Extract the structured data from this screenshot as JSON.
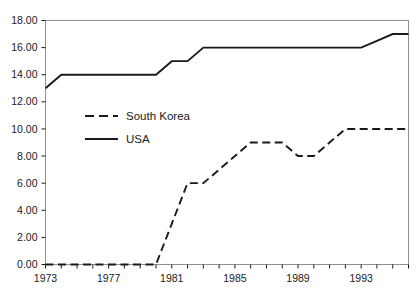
{
  "chart_data": {
    "type": "line",
    "title": "",
    "subtitle": "",
    "xlabel": "",
    "ylabel": "",
    "xlim": [
      1973,
      1996
    ],
    "ylim": [
      0,
      18
    ],
    "xticks": [
      1973,
      1974,
      1975,
      1976,
      1977,
      1978,
      1979,
      1980,
      1981,
      1982,
      1983,
      1984,
      1985,
      1986,
      1987,
      1988,
      1989,
      1990,
      1991,
      1992,
      1993,
      1994,
      1995,
      1996
    ],
    "xtick_labels": [
      "1973",
      "",
      "",
      "",
      "1977",
      "",
      "",
      "",
      "1981",
      "",
      "",
      "",
      "1985",
      "",
      "",
      "",
      "1989",
      "",
      "",
      "",
      "1993",
      "",
      "",
      ""
    ],
    "yticks": [
      0,
      2,
      4,
      6,
      8,
      10,
      12,
      14,
      16,
      18
    ],
    "ytick_labels": [
      "0.00",
      "2.00",
      "4.00",
      "6.00",
      "8.00",
      "10.00",
      "12.00",
      "14.00",
      "16.00",
      "18.00"
    ],
    "grid": false,
    "legend_position": "inside-center-left",
    "x": [
      1973,
      1974,
      1975,
      1976,
      1977,
      1978,
      1979,
      1980,
      1981,
      1982,
      1983,
      1984,
      1985,
      1986,
      1987,
      1988,
      1989,
      1990,
      1991,
      1992,
      1993,
      1994,
      1995,
      1996
    ],
    "series": [
      {
        "name": "South Korea",
        "style": "dashed",
        "color": "#1a1a1a",
        "values": [
          0,
          0,
          0,
          0,
          0,
          0,
          0,
          0,
          3,
          6,
          6,
          7,
          8,
          9,
          9,
          9,
          8,
          8,
          9,
          10,
          10,
          10,
          10,
          10
        ]
      },
      {
        "name": "USA",
        "style": "solid",
        "color": "#1a1a1a",
        "values": [
          13,
          14,
          14,
          14,
          14,
          14,
          14,
          14,
          15,
          15,
          16,
          16,
          16,
          16,
          16,
          16,
          16,
          16,
          16,
          16,
          16,
          16.5,
          17,
          17
        ]
      }
    ]
  },
  "axes": {
    "frame_color": "#808080",
    "tick_color": "#1a1a1a"
  },
  "legend": {
    "entries": [
      {
        "label": "South Korea",
        "style": "dashed"
      },
      {
        "label": "USA",
        "style": "solid"
      }
    ]
  }
}
